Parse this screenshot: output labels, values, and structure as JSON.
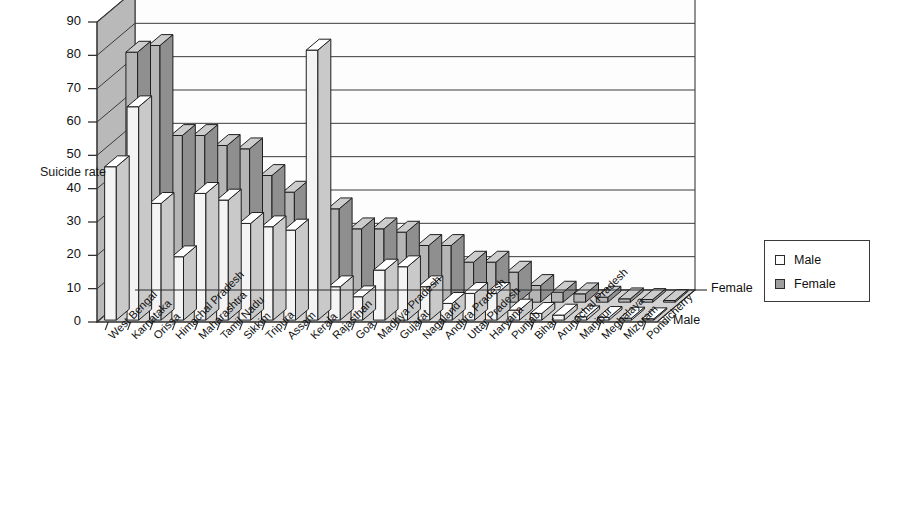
{
  "chart_data": {
    "type": "bar",
    "title": "",
    "subtitle": "",
    "xlabel": "",
    "ylabel": "Suicide rate",
    "zlabel": "",
    "ylim": [
      0,
      90
    ],
    "ytick_step": 10,
    "yticks": [
      "90",
      "80",
      "70",
      "60",
      "50",
      "40",
      "30",
      "20",
      "10",
      "0"
    ],
    "grid": true,
    "three_d": true,
    "legend_position": "right",
    "depth_axis_labels": [
      "Female",
      "Male"
    ],
    "categories": [
      "West Bengal",
      "Karnataka",
      "Orissa",
      "Himachal Pradesh",
      "Maharashtra",
      "Tamil Nadu",
      "Sikkim",
      "Tripura",
      "Assam",
      "Kerala",
      "Rajasthan",
      "Goa",
      "Madhya Pradesh",
      "Gujarat",
      "Nagaland",
      "Andhra Pradesh",
      "Uttar Pradesh",
      "Haryana",
      "Punjab",
      "Bihar",
      "Arunachal Pradesh",
      "Manipur",
      "Meghalaya",
      "Mizoram",
      "Pondicherry"
    ],
    "series": [
      {
        "name": "Female",
        "color": "#b5b5b5",
        "values": [
          75,
          77,
          50,
          50,
          47,
          46,
          38,
          33,
          33,
          28,
          22,
          22,
          21,
          17,
          17,
          12,
          12,
          9,
          5,
          3,
          2.5,
          1.5,
          1,
          0.8,
          0.5
        ]
      },
      {
        "name": "Male",
        "color": "#f2f2f2",
        "values": [
          46,
          64,
          35,
          19,
          38,
          36,
          29,
          28,
          27,
          81,
          10,
          7,
          15,
          16,
          10,
          5,
          8,
          8,
          3,
          2,
          1.5,
          1,
          0.8,
          0.6,
          0.4
        ]
      }
    ]
  },
  "legend": {
    "items": [
      {
        "label": "Male",
        "swatch_color": "#fcfcfc"
      },
      {
        "label": "Female",
        "swatch_color": "#9e9e9e"
      }
    ]
  }
}
